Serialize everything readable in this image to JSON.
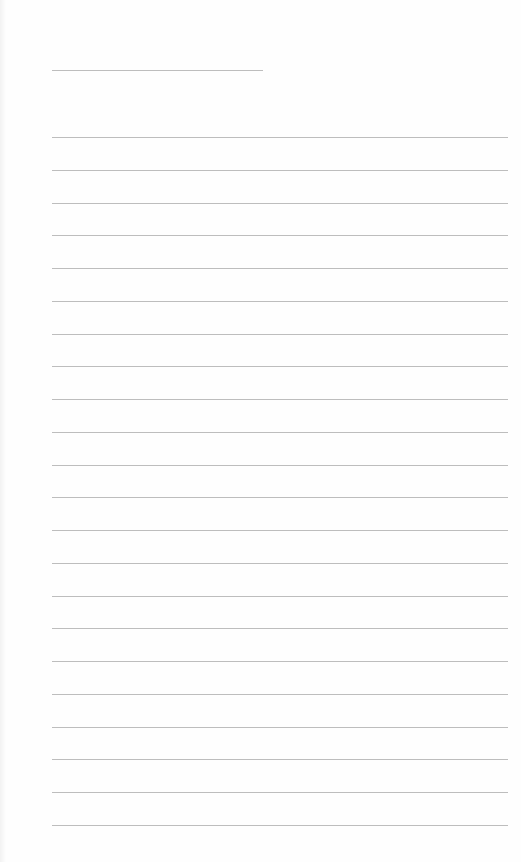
{
  "page": {
    "type": "lined-paper",
    "background_color": "#fefefe",
    "line_color": "#bdbdbd",
    "title_line": {
      "x": 52,
      "y": 70,
      "width": 211
    },
    "ruled_lines": {
      "count": 22,
      "x_start": 52,
      "x_end": 508,
      "first_y": 137,
      "spacing": 32.75
    }
  }
}
